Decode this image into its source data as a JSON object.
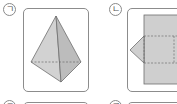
{
  "figures": [
    {
      "label": "ㄱ",
      "name": "triangular-pyramid",
      "description": "3D triangular pyramid with hidden base edge dashed"
    },
    {
      "label": "ㄴ",
      "name": "net-figure",
      "description": "Net: rectangle with dashed fold lines and triangular flap on left"
    }
  ],
  "next_row_labels": [
    "ㄷ",
    "ㄹ"
  ],
  "colors": {
    "fill": "#cfcfcf",
    "fill_dark": "#bdbdbd",
    "stroke": "#6e6e6e",
    "frame": "#8c8c8c"
  }
}
